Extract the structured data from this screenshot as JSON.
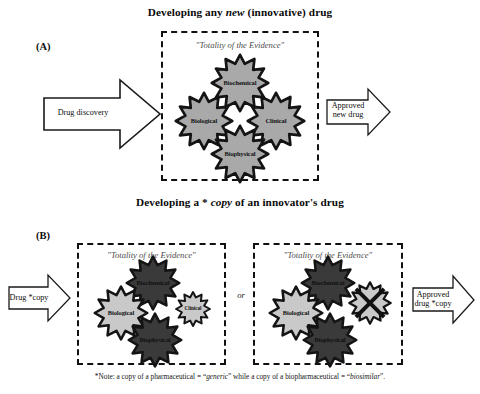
{
  "figure": {
    "panels": [
      {
        "id": "A",
        "label": "(A)",
        "title_parts": [
          "Developing any ",
          "new",
          " (innovative) drug"
        ],
        "title_plain": "Developing any new (innovative) drug",
        "input_arrow_label": "Drug discovery",
        "output_arrow_label": "Approved\nnew drug",
        "box": {
          "caption": "\"Totality of the Evidence\"",
          "gears": [
            {
              "name": "Biochemical",
              "position": "top",
              "shade": "#a9a9a9",
              "size": "large"
            },
            {
              "name": "Biological",
              "position": "left",
              "shade": "#a9a9a9",
              "size": "large"
            },
            {
              "name": "Clinical",
              "position": "right",
              "shade": "#a9a9a9",
              "size": "large"
            },
            {
              "name": "Biophysical",
              "position": "bottom",
              "shade": "#a9a9a9",
              "size": "large"
            }
          ]
        }
      },
      {
        "id": "B",
        "label": "(B)",
        "title_parts": [
          "Developing a * ",
          "copy",
          " of an innovator's drug"
        ],
        "title_plain": "Developing a * copy of an innovator's drug",
        "input_arrow_label": "Drug *copy",
        "output_arrow_label": "Approved\ndrug *copy",
        "connector": "or",
        "boxes": [
          {
            "caption": "\"Totality of the Evidence\"",
            "gears": [
              {
                "name": "Biochemical",
                "position": "top",
                "shade": "#3a3a3a",
                "size": "large"
              },
              {
                "name": "Biological",
                "position": "left",
                "shade": "#c9c9c9",
                "size": "large"
              },
              {
                "name": "Clinical",
                "position": "right",
                "shade": "#c9c9c9",
                "size": "small"
              },
              {
                "name": "Biophysical",
                "position": "bottom",
                "shade": "#3a3a3a",
                "size": "large"
              }
            ]
          },
          {
            "caption": "\"Totality of the Evidence\"",
            "gears": [
              {
                "name": "Biochemical",
                "position": "top",
                "shade": "#3a3a3a",
                "size": "large"
              },
              {
                "name": "Biological",
                "position": "left",
                "shade": "#c9c9c9",
                "size": "large"
              },
              {
                "name": "",
                "position": "right",
                "shade": "#c9c9c9",
                "size": "small",
                "crossed_out": true
              },
              {
                "name": "Biophysical",
                "position": "bottom",
                "shade": "#3a3a3a",
                "size": "large"
              }
            ]
          }
        ]
      }
    ],
    "footnote": {
      "parts": [
        "*Note: a copy of a pharmaceutical = “",
        "generic",
        "” while a copy of a biopharmaceutical = “",
        "biosimilar",
        "”."
      ],
      "plain": "*Note: a copy of a pharmaceutical = “generic” while a copy of a biopharmaceutical = “biosimilar”."
    },
    "colors": {
      "gear_mid": "#a9a9a9",
      "gear_dark": "#3a3a3a",
      "gear_light": "#c9c9c9",
      "outline": "#111111",
      "caption_gray": "#4c4c4c"
    }
  }
}
